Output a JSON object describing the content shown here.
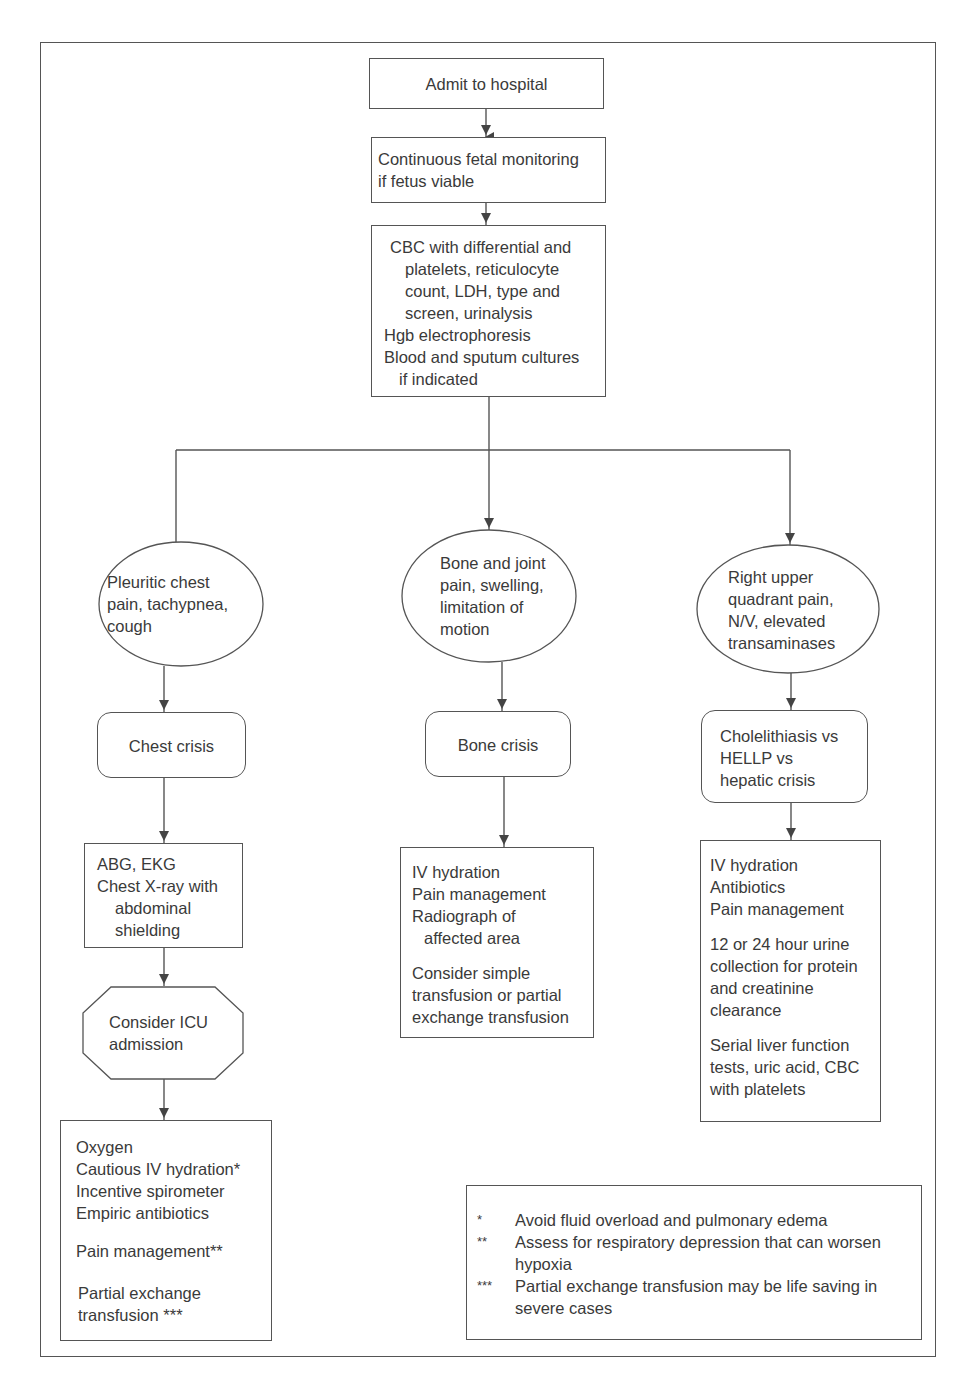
{
  "diagram": {
    "type": "flowchart",
    "nodes": {
      "admit": {
        "shape": "rectangle",
        "lines": [
          "Admit to hospital"
        ]
      },
      "fetal": {
        "shape": "rectangle",
        "lines": [
          "Continuous fetal monitoring",
          "if fetus viable"
        ]
      },
      "labs": {
        "shape": "rectangle",
        "lines": [
          "CBC with differential and",
          "platelets, reticulocyte",
          "count, LDH, type and",
          "screen, urinalysis",
          "Hgb electrophoresis",
          "Blood and sputum cultures",
          "if indicated"
        ]
      },
      "chest_sym": {
        "shape": "ellipse",
        "lines": [
          "Pleuritic chest",
          "pain, tachypnea,",
          "cough"
        ]
      },
      "bone_sym": {
        "shape": "ellipse",
        "lines": [
          "Bone and joint",
          "pain, swelling,",
          "limitation of",
          "motion"
        ]
      },
      "ruq_sym": {
        "shape": "ellipse",
        "lines": [
          "Right upper",
          "quadrant pain,",
          "N/V, elevated",
          "transaminases"
        ]
      },
      "chest_crisis": {
        "shape": "rounded-rectangle",
        "lines": [
          "Chest crisis"
        ]
      },
      "bone_crisis": {
        "shape": "rounded-rectangle",
        "lines": [
          "Bone crisis"
        ]
      },
      "hepatic_dx": {
        "shape": "rounded-rectangle",
        "lines": [
          "Cholelithiasis vs",
          "HELLP vs",
          "hepatic crisis"
        ]
      },
      "chest_workup": {
        "shape": "rectangle",
        "lines": [
          "ABG, EKG",
          "Chest X-ray with",
          "abdominal",
          "shielding"
        ]
      },
      "icu": {
        "shape": "octagon",
        "lines": [
          "Consider ICU",
          "admission"
        ]
      },
      "chest_tx": {
        "shape": "rectangle",
        "group1": [
          "Oxygen",
          "Cautious IV hydration*",
          "Incentive spirometer",
          "Empiric antibiotics"
        ],
        "group2": [
          "Pain management**"
        ],
        "group3": [
          "Partial exchange",
          "transfusion ***"
        ]
      },
      "bone_tx": {
        "shape": "rectangle",
        "group1": [
          "IV hydration",
          "Pain management",
          "Radiograph of",
          "affected area"
        ],
        "group2": [
          "Consider simple",
          "transfusion or partial",
          "exchange transfusion"
        ]
      },
      "hepatic_tx": {
        "shape": "rectangle",
        "group1": [
          "IV hydration",
          "Antibiotics",
          "Pain management"
        ],
        "group2": [
          "12 or 24 hour urine",
          "collection for protein",
          "and creatinine",
          "clearance"
        ],
        "group3": [
          "Serial liver function",
          "tests, uric acid, CBC",
          "with platelets"
        ]
      }
    },
    "edges": [
      [
        "admit",
        "fetal"
      ],
      [
        "fetal",
        "labs"
      ],
      [
        "labs",
        "chest_sym"
      ],
      [
        "labs",
        "bone_sym"
      ],
      [
        "labs",
        "ruq_sym"
      ],
      [
        "chest_sym",
        "chest_crisis"
      ],
      [
        "chest_crisis",
        "chest_workup"
      ],
      [
        "chest_workup",
        "icu"
      ],
      [
        "icu",
        "chest_tx"
      ],
      [
        "bone_sym",
        "bone_crisis"
      ],
      [
        "bone_crisis",
        "bone_tx"
      ],
      [
        "ruq_sym",
        "hepatic_dx"
      ],
      [
        "hepatic_dx",
        "hepatic_tx"
      ]
    ],
    "footnotes": [
      {
        "mark": "*",
        "lines": [
          "Avoid fluid overload and pulmonary edema"
        ]
      },
      {
        "mark": "**",
        "lines": [
          "Assess for respiratory depression that can worsen",
          "hypoxia"
        ]
      },
      {
        "mark": "***",
        "lines": [
          "Partial exchange transfusion may be life saving in",
          "severe cases"
        ]
      }
    ],
    "colors": {
      "line": "#555555",
      "text": "#3a3a3a",
      "background": "#ffffff"
    }
  }
}
